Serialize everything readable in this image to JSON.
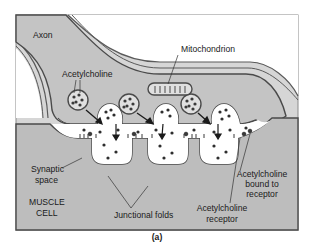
{
  "figure": {
    "caption": "(a)",
    "colors": {
      "frame": "#8a8a8a",
      "axon_fill": "#c4c4c4",
      "muscle_fill": "#bdbdbd",
      "synaptic_space": "#ffffff",
      "membrane": "#4a4a4a",
      "vesicle_dot": "#3a3a3a",
      "text": "#1a1a1a"
    }
  },
  "labels": {
    "axon": "Axon",
    "mitochondrion": "Mitochondrion",
    "acetylcholine": "Acetylcholine",
    "synaptic_space_1": "Synaptic",
    "synaptic_space_2": "space",
    "muscle_cell_1": "MUSCLE",
    "muscle_cell_2": "CELL",
    "junctional_folds": "Junctional folds",
    "ach_bound_1": "Acetylcholine",
    "ach_bound_2": "bound to",
    "ach_bound_3": "receptor",
    "ach_receptor_1": "Acetylcholine",
    "ach_receptor_2": "receptor"
  }
}
